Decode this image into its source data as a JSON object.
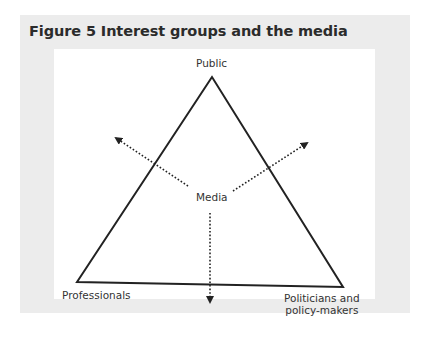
{
  "figure": {
    "title": "Figure 5 Interest groups and the media",
    "nodes": {
      "top": "Public",
      "center": "Media",
      "bottom_left": "Professionals",
      "bottom_right_line1": "Politicians and",
      "bottom_right_line2": "policy-makers"
    },
    "colors": {
      "panel_background": "#ececec",
      "diagram_background": "#ffffff",
      "line": "#222222",
      "text": "#333333"
    }
  }
}
